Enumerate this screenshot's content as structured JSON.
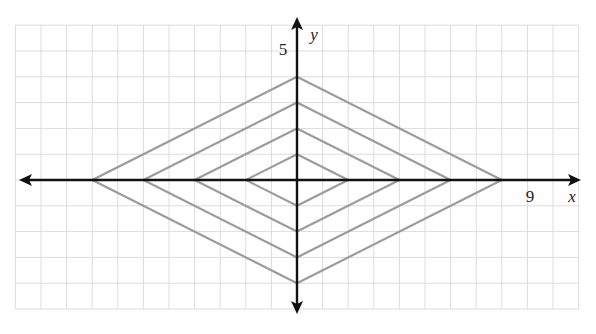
{
  "chart_data": {
    "type": "line",
    "title": "",
    "xlabel": "x",
    "ylabel": "y",
    "xlim": [
      -11,
      11
    ],
    "ylim": [
      -5,
      6
    ],
    "grid": true,
    "tick_labels": {
      "x": [
        {
          "value": 9,
          "label": "9"
        }
      ],
      "y": [
        {
          "value": 5,
          "label": "5"
        }
      ]
    },
    "series": [
      {
        "name": "diamond k=1",
        "equation": "|x|/2 + |y| = 1",
        "vertices": [
          [
            2,
            0
          ],
          [
            0,
            1
          ],
          [
            -2,
            0
          ],
          [
            0,
            -1
          ],
          [
            2,
            0
          ]
        ]
      },
      {
        "name": "diamond k=2",
        "equation": "|x|/2 + |y| = 2",
        "vertices": [
          [
            4,
            0
          ],
          [
            0,
            2
          ],
          [
            -4,
            0
          ],
          [
            0,
            -2
          ],
          [
            4,
            0
          ]
        ]
      },
      {
        "name": "diamond k=3",
        "equation": "|x|/2 + |y| = 3",
        "vertices": [
          [
            6,
            0
          ],
          [
            0,
            3
          ],
          [
            -6,
            0
          ],
          [
            0,
            -3
          ],
          [
            6,
            0
          ]
        ]
      },
      {
        "name": "diamond k=4",
        "equation": "|x|/2 + |y| = 4",
        "vertices": [
          [
            8,
            0
          ],
          [
            0,
            4
          ],
          [
            -8,
            0
          ],
          [
            0,
            -4
          ],
          [
            8,
            0
          ]
        ]
      }
    ],
    "colors": {
      "grid": "#dcdcdc",
      "axes": "#111111",
      "curves": "#9c9c9c"
    },
    "legend": null
  },
  "labels": {
    "x_axis": "x",
    "y_axis": "y",
    "x_tick": "9",
    "y_tick": "5"
  }
}
